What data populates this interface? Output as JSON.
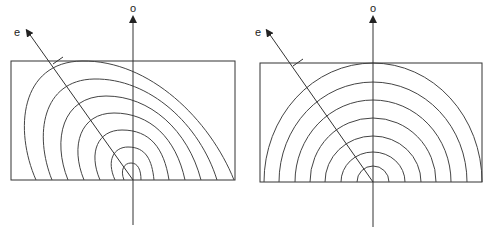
{
  "colors": {
    "line": "#333333",
    "background": "#ffffff"
  },
  "panels": [
    {
      "id": "left",
      "description": "skewed elliptical contours",
      "axis_o_label": "o",
      "axis_e_label": "e",
      "arc_count": 7
    },
    {
      "id": "right",
      "description": "concentric semicircular contours",
      "axis_o_label": "o",
      "axis_e_label": "e",
      "arc_count": 7
    }
  ]
}
